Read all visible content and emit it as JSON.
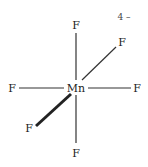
{
  "diagram": {
    "central_atom": "Mn",
    "charge": "4 –",
    "ligands": [
      {
        "label": "F",
        "position": "top"
      },
      {
        "label": "F",
        "position": "upper-right"
      },
      {
        "label": "F",
        "position": "left"
      },
      {
        "label": "F",
        "position": "right"
      },
      {
        "label": "F",
        "position": "lower-left"
      },
      {
        "label": "F",
        "position": "bottom"
      }
    ],
    "colors": {
      "bond": "#333333",
      "text": "#222222",
      "background": "#ffffff"
    }
  }
}
